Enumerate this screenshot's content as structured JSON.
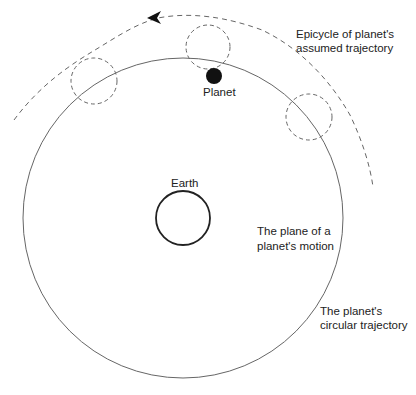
{
  "labels": {
    "epicycle_line1": "Epicycle of planet's",
    "epicycle_line2": "assumed trajectory",
    "planet": "Planet",
    "earth": "Earth",
    "plane_line1": "The plane of a",
    "plane_line2": "planet's motion",
    "circular_line1": "The planet's",
    "circular_line2": "circular trajectory"
  },
  "colors": {
    "stroke": "#555555",
    "earth_stroke": "#222222",
    "planet_fill": "#111111",
    "background": "#ffffff"
  },
  "geometry": {
    "main_circle": {
      "cx": 183,
      "cy": 218,
      "r": 160
    },
    "earth": {
      "cx": 183,
      "cy": 218,
      "r": 27
    },
    "planet": {
      "cx": 214,
      "cy": 76,
      "r": 8
    },
    "epicycles": [
      {
        "cx": 94,
        "cy": 81,
        "r": 23
      },
      {
        "cx": 208,
        "cy": 47,
        "r": 22
      },
      {
        "cx": 309,
        "cy": 117,
        "r": 23
      }
    ]
  }
}
